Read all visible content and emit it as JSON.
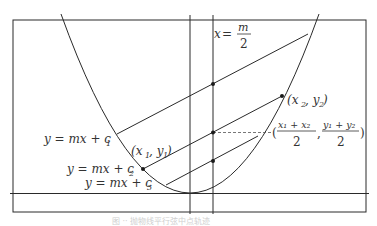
{
  "figure": {
    "colors": {
      "stroke": "#2a2a2a",
      "background": "#ffffff",
      "caption": "#cfcfcf"
    },
    "labels": {
      "axis_line": {
        "lhs": "x",
        "eq": " = ",
        "num": "m",
        "den": "2"
      },
      "chord_1": {
        "text": "y = mx + c",
        "sub": "1"
      },
      "chord_2": {
        "text": "y = mx + c",
        "sub": "2"
      },
      "chord_3": {
        "text": "y = mx + c",
        "sub": "3"
      },
      "point_1": {
        "open": "(x",
        "sub_a": "1",
        "mid": ", y",
        "sub_b": "1",
        "close": ")"
      },
      "point_2": {
        "open": "(x",
        "sub_a": "2",
        "mid": ", y",
        "sub_b": "2",
        "close": ")"
      },
      "midpoint": {
        "open": "(",
        "x_num": "x₁ + x₂",
        "y_num": "y₁ + y₂",
        "den": "2",
        "comma": ",",
        "close": ")"
      }
    },
    "caption": "图 ·· 抛物线平行弦中点轨迹"
  }
}
